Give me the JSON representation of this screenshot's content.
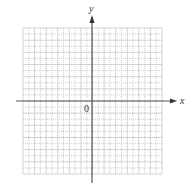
{
  "diagram": {
    "type": "coordinate-plane",
    "axes": {
      "x_label": "x",
      "y_label": "y",
      "origin_label": "0"
    },
    "grid": {
      "columns": 12,
      "rows": 12,
      "minor_dotted": true,
      "line_color": "#c8c8c8",
      "minor_color": "#bdbdbd"
    },
    "axis_color": "#555555"
  }
}
